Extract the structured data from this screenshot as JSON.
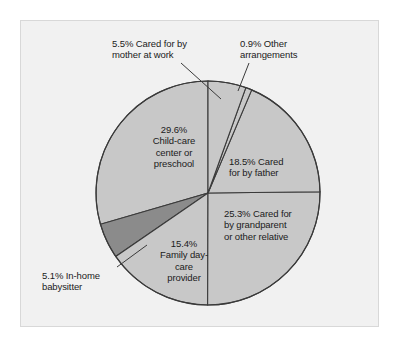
{
  "figure": {
    "background_color": "#ffffff",
    "panel_color": "#f1f1f1",
    "border_color": "#d8d8d8"
  },
  "chart_data": {
    "type": "pie",
    "title": "",
    "xlabel": "",
    "ylabel": "",
    "legend_position": "none",
    "grid": false,
    "start_angle_deg": 90,
    "direction": "clockwise",
    "units": "percent",
    "total": 100.3,
    "center": {
      "x": 208,
      "y": 193
    },
    "radius": 112,
    "categories": [
      "5.5% Cared for by mother at work",
      "0.9% Other arrangements",
      "18.5% Cared for by father",
      "25.3% Cared for by grandparent or other relative",
      "15.4% Family day-care provider",
      "5.1% In-home babysitter",
      "29.6% Child-care center or preschool"
    ],
    "values": [
      5.5,
      0.9,
      18.5,
      25.3,
      15.4,
      5.1,
      29.6
    ],
    "slice_colors": [
      "#c8c8c8",
      "#c8c8c8",
      "#c8c8c8",
      "#c8c8c8",
      "#c8c8c8",
      "#8b8b8b",
      "#c8c8c8"
    ],
    "slice_edge_color": "#3a3a3a",
    "slices": [
      {
        "label": "5.5% Cared for by mother at work",
        "value": 5.5,
        "fill": "#c8c8c8",
        "callout": true
      },
      {
        "label": "0.9% Other arrangements",
        "value": 0.9,
        "fill": "#c8c8c8",
        "callout": true
      },
      {
        "label": "18.5% Cared for by father",
        "value": 18.5,
        "fill": "#c8c8c8",
        "callout": false
      },
      {
        "label": "25.3% Cared for by grandparent or other relative",
        "value": 25.3,
        "fill": "#c8c8c8",
        "callout": false
      },
      {
        "label": "15.4% Family day-care provider",
        "value": 15.4,
        "fill": "#c8c8c8",
        "callout": false
      },
      {
        "label": "5.1% In-home babysitter",
        "value": 5.1,
        "fill": "#8b8b8b",
        "callout": true
      },
      {
        "label": "29.6% Child-care center or preschool",
        "value": 29.6,
        "fill": "#c8c8c8",
        "callout": false
      }
    ]
  },
  "labels": {
    "mother": {
      "line1": "5.5% Cared for by",
      "line2": "mother at work"
    },
    "other": {
      "line1": "0.9% Other",
      "line2": "arrangements"
    },
    "childcare": {
      "line1": "29.6%",
      "line2": "Child-care",
      "line3": "center or",
      "line4": "preschool"
    },
    "father": {
      "line1": "18.5% Cared",
      "line2": "for by father"
    },
    "grandparent": {
      "line1": "25.3% Cared for",
      "line2": "by grandparent",
      "line3": "or other relative"
    },
    "family": {
      "line1": "15.4%",
      "line2": "Family day-",
      "line3": "care",
      "line4": "provider"
    },
    "babysitter": {
      "line1": "5.1% In-home",
      "line2": "babysitter"
    }
  }
}
